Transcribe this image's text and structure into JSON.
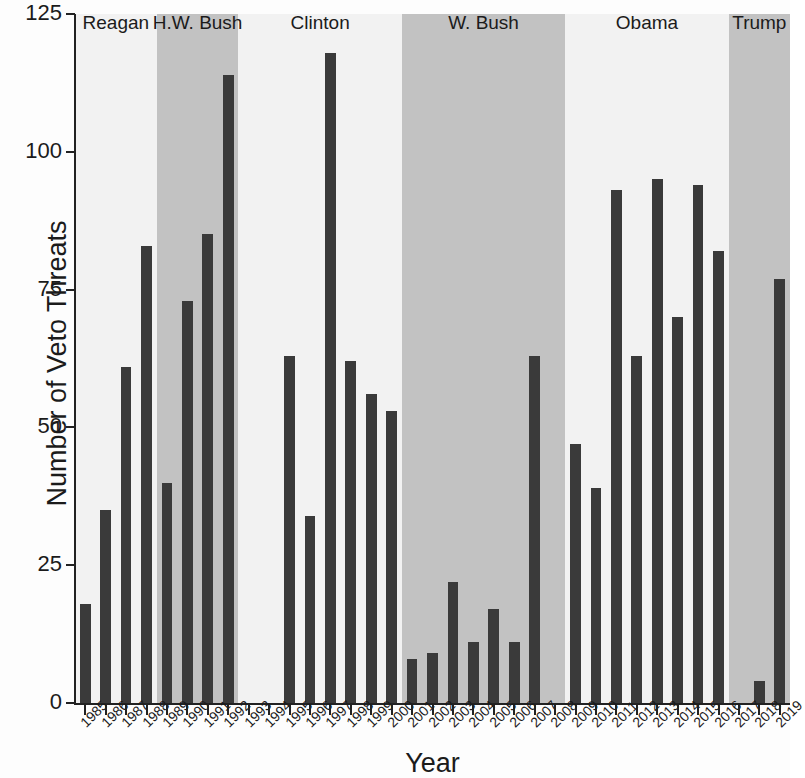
{
  "chart_data": {
    "type": "bar",
    "title": "",
    "xlabel": "Year",
    "ylabel": "Number of Veto Threats",
    "ylim": [
      0,
      125
    ],
    "yticks": [
      0,
      25,
      50,
      75,
      100,
      125
    ],
    "grid": false,
    "legend": "none",
    "bar_color": "#3a3a3a",
    "plot_background": "#f2f2f2",
    "shade_color": "#c2c2c2",
    "categories": [
      "1985",
      "1986",
      "1987",
      "1988",
      "1989",
      "1990",
      "1991",
      "1992",
      "1993",
      "1994",
      "1995",
      "1996",
      "1997",
      "1998",
      "1999",
      "2000",
      "2001",
      "2002",
      "2003",
      "2004",
      "2005",
      "2006",
      "2007",
      "2008",
      "2009",
      "2010",
      "2011",
      "2012",
      "2013",
      "2014",
      "2015",
      "2016",
      "2017",
      "2018",
      "2019"
    ],
    "values": [
      18,
      35,
      61,
      83,
      40,
      73,
      85,
      114,
      0,
      0,
      63,
      34,
      118,
      62,
      56,
      53,
      8,
      9,
      22,
      11,
      17,
      11,
      63,
      0,
      47,
      39,
      93,
      63,
      95,
      70,
      94,
      82,
      0,
      4,
      77
    ],
    "annotations": [
      {
        "label": "Reagan",
        "start_year": "1985",
        "end_year": "1988",
        "shaded": false
      },
      {
        "label": "H.W. Bush",
        "start_year": "1989",
        "end_year": "1992",
        "shaded": true
      },
      {
        "label": "Clinton",
        "start_year": "1993",
        "end_year": "2000",
        "shaded": false
      },
      {
        "label": "W. Bush",
        "start_year": "2001",
        "end_year": "2008",
        "shaded": true
      },
      {
        "label": "Obama",
        "start_year": "2009",
        "end_year": "2016",
        "shaded": false
      },
      {
        "label": "Trump",
        "start_year": "2017",
        "end_year": "2019",
        "shaded": true
      }
    ]
  }
}
